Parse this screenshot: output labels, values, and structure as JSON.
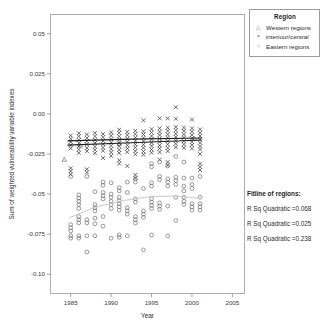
{
  "chart_data": {
    "type": "scatter",
    "title": "",
    "xlabel": "Year",
    "ylabel": "Sum of weighted vulnerability variable indexes",
    "xlim": [
      1982.5,
      2006.5
    ],
    "ylim": [
      -0.112,
      0.062
    ],
    "xticks": [
      "1985",
      "1990",
      "1995",
      "2000",
      "2005"
    ],
    "xtick_values": [
      1985,
      1990,
      1995,
      2000,
      2005
    ],
    "yticks": [
      "0.05",
      "0.025",
      "0.00",
      "-0.025",
      "-0.05",
      "-0.075",
      "-0.10"
    ],
    "ytick_values": [
      0.05,
      0.025,
      0.0,
      -0.025,
      -0.05,
      -0.075,
      -0.1
    ],
    "grid": false,
    "legend_position": "top-right",
    "series": [
      {
        "name": "Western regions",
        "marker": "triangle",
        "color": "#6e6e6e",
        "points": [
          [
            1984.2,
            -0.0285
          ],
          [
            1986.2,
            -0.0195
          ],
          [
            1991.0,
            -0.0185
          ],
          [
            2000.3,
            -0.0155
          ]
        ]
      },
      {
        "name": "interiour/central",
        "marker": "x",
        "color": "#3a3a3a",
        "points": [
          [
            1985.0,
            -0.0135
          ],
          [
            1985.0,
            -0.0155
          ],
          [
            1985.0,
            -0.0175
          ],
          [
            1985.0,
            -0.0195
          ],
          [
            1985.0,
            -0.0215
          ],
          [
            1985.0,
            -0.0338
          ],
          [
            1985.0,
            -0.0358
          ],
          [
            1985.0,
            -0.0378
          ],
          [
            1986.0,
            -0.012
          ],
          [
            1986.0,
            -0.014
          ],
          [
            1986.0,
            -0.0162
          ],
          [
            1986.0,
            -0.0182
          ],
          [
            1986.0,
            -0.0202
          ],
          [
            1986.0,
            -0.0222
          ],
          [
            1986.0,
            -0.0243
          ],
          [
            1987.0,
            -0.0128
          ],
          [
            1987.0,
            -0.015
          ],
          [
            1987.0,
            -0.017
          ],
          [
            1987.0,
            -0.019
          ],
          [
            1987.0,
            -0.0212
          ],
          [
            1987.0,
            -0.0232
          ],
          [
            1987.0,
            -0.0345
          ],
          [
            1987.0,
            -0.0365
          ],
          [
            1988.0,
            -0.0118
          ],
          [
            1988.0,
            -0.014
          ],
          [
            1988.0,
            -0.0162
          ],
          [
            1988.0,
            -0.0182
          ],
          [
            1988.0,
            -0.0204
          ],
          [
            1988.0,
            -0.0224
          ],
          [
            1988.0,
            -0.0245
          ],
          [
            1989.0,
            -0.0125
          ],
          [
            1989.0,
            -0.0146
          ],
          [
            1989.0,
            -0.0168
          ],
          [
            1989.0,
            -0.0188
          ],
          [
            1989.0,
            -0.021
          ],
          [
            1989.0,
            -0.023
          ],
          [
            1989.0,
            -0.0275
          ],
          [
            1990.0,
            -0.0115
          ],
          [
            1990.0,
            -0.0136
          ],
          [
            1990.0,
            -0.0158
          ],
          [
            1990.0,
            -0.0178
          ],
          [
            1990.0,
            -0.0198
          ],
          [
            1990.0,
            -0.022
          ],
          [
            1990.0,
            -0.024
          ],
          [
            1990.0,
            -0.0262
          ],
          [
            1991.0,
            -0.0098
          ],
          [
            1991.0,
            -0.0118
          ],
          [
            1991.0,
            -0.014
          ],
          [
            1991.0,
            -0.016
          ],
          [
            1991.0,
            -0.0182
          ],
          [
            1991.0,
            -0.0202
          ],
          [
            1991.0,
            -0.0224
          ],
          [
            1991.0,
            -0.0244
          ],
          [
            1991.0,
            -0.029
          ],
          [
            1991.0,
            -0.031
          ],
          [
            1992.0,
            -0.0112
          ],
          [
            1992.0,
            -0.0132
          ],
          [
            1992.0,
            -0.0154
          ],
          [
            1992.0,
            -0.0174
          ],
          [
            1992.0,
            -0.0196
          ],
          [
            1992.0,
            -0.0216
          ],
          [
            1992.0,
            -0.0238
          ],
          [
            1992.0,
            -0.0325
          ],
          [
            1993.0,
            -0.0105
          ],
          [
            1993.0,
            -0.0126
          ],
          [
            1993.0,
            -0.0148
          ],
          [
            1993.0,
            -0.0168
          ],
          [
            1993.0,
            -0.019
          ],
          [
            1993.0,
            -0.021
          ],
          [
            1993.0,
            -0.0232
          ],
          [
            1993.0,
            -0.0252
          ],
          [
            1993.0,
            -0.038
          ],
          [
            1993.0,
            -0.04
          ],
          [
            1994.0,
            -0.004
          ],
          [
            1994.0,
            -0.0108
          ],
          [
            1994.0,
            -0.0128
          ],
          [
            1994.0,
            -0.015
          ],
          [
            1994.0,
            -0.017
          ],
          [
            1994.0,
            -0.0192
          ],
          [
            1994.0,
            -0.0212
          ],
          [
            1994.0,
            -0.0234
          ],
          [
            1994.0,
            -0.0254
          ],
          [
            1995.0,
            -0.0095
          ],
          [
            1995.0,
            -0.0116
          ],
          [
            1995.0,
            -0.0138
          ],
          [
            1995.0,
            -0.0158
          ],
          [
            1995.0,
            -0.018
          ],
          [
            1995.0,
            -0.02
          ],
          [
            1995.0,
            -0.0222
          ],
          [
            1995.0,
            -0.0242
          ],
          [
            1996.0,
            -0.0028
          ],
          [
            1996.0,
            -0.009
          ],
          [
            1996.0,
            -0.0112
          ],
          [
            1996.0,
            -0.0132
          ],
          [
            1996.0,
            -0.0154
          ],
          [
            1996.0,
            -0.0174
          ],
          [
            1996.0,
            -0.0196
          ],
          [
            1996.0,
            -0.0216
          ],
          [
            1996.0,
            -0.0238
          ],
          [
            1996.0,
            -0.0285
          ],
          [
            1997.0,
            -0.0028
          ],
          [
            1997.0,
            -0.0086
          ],
          [
            1997.0,
            -0.0106
          ],
          [
            1997.0,
            -0.0128
          ],
          [
            1997.0,
            -0.0148
          ],
          [
            1997.0,
            -0.017
          ],
          [
            1997.0,
            -0.019
          ],
          [
            1997.0,
            -0.0212
          ],
          [
            1997.0,
            -0.0232
          ],
          [
            1997.0,
            -0.03
          ],
          [
            1997.0,
            -0.032
          ],
          [
            1998.0,
            0.0042
          ],
          [
            1998.0,
            -0.003
          ],
          [
            1998.0,
            -0.0082
          ],
          [
            1998.0,
            -0.0102
          ],
          [
            1998.0,
            -0.0124
          ],
          [
            1998.0,
            -0.0144
          ],
          [
            1998.0,
            -0.0166
          ],
          [
            1998.0,
            -0.0186
          ],
          [
            1998.0,
            -0.0208
          ],
          [
            1999.0,
            -0.0085
          ],
          [
            1999.0,
            -0.0106
          ],
          [
            1999.0,
            -0.0128
          ],
          [
            1999.0,
            -0.0148
          ],
          [
            1999.0,
            -0.017
          ],
          [
            1999.0,
            -0.019
          ],
          [
            1999.0,
            -0.0212
          ],
          [
            2000.0,
            -0.0035
          ],
          [
            2000.0,
            -0.009
          ],
          [
            2000.0,
            -0.011
          ],
          [
            2000.0,
            -0.0132
          ],
          [
            2000.0,
            -0.0152
          ],
          [
            2000.0,
            -0.0174
          ],
          [
            2000.0,
            -0.0194
          ],
          [
            2000.0,
            -0.0216
          ],
          [
            2001.0,
            -0.0096
          ],
          [
            2001.0,
            -0.0118
          ],
          [
            2001.0,
            -0.0138
          ],
          [
            2001.0,
            -0.016
          ],
          [
            2001.0,
            -0.018
          ],
          [
            2001.0,
            -0.0202
          ],
          [
            2001.0,
            -0.0222
          ],
          [
            2001.0,
            -0.025
          ],
          [
            2001.0,
            -0.031
          ],
          [
            2001.0,
            -0.033
          ],
          [
            2001.0,
            -0.035
          ]
        ]
      },
      {
        "name": "Eastern regions",
        "marker": "circle",
        "color": "#6e6e6e",
        "points": [
          [
            1985.0,
            -0.039
          ],
          [
            1985.0,
            -0.069
          ],
          [
            1985.0,
            -0.071
          ],
          [
            1985.0,
            -0.073
          ],
          [
            1985.0,
            -0.076
          ],
          [
            1985.0,
            -0.0775
          ],
          [
            1986.0,
            -0.0505
          ],
          [
            1986.0,
            -0.0525
          ],
          [
            1986.0,
            -0.0545
          ],
          [
            1986.0,
            -0.0565
          ],
          [
            1986.0,
            -0.059
          ],
          [
            1986.0,
            -0.064
          ],
          [
            1986.0,
            -0.066
          ],
          [
            1986.0,
            -0.068
          ],
          [
            1986.0,
            -0.076
          ],
          [
            1986.0,
            -0.0775
          ],
          [
            1987.0,
            -0.039
          ],
          [
            1987.0,
            -0.066
          ],
          [
            1987.0,
            -0.068
          ],
          [
            1987.0,
            -0.076
          ],
          [
            1987.0,
            -0.0862
          ],
          [
            1988.0,
            -0.0485
          ],
          [
            1988.0,
            -0.0565
          ],
          [
            1988.0,
            -0.0585
          ],
          [
            1988.0,
            -0.0605
          ],
          [
            1988.0,
            -0.065
          ],
          [
            1988.0,
            -0.0685
          ],
          [
            1988.0,
            -0.076
          ],
          [
            1989.0,
            -0.0425
          ],
          [
            1989.0,
            -0.0445
          ],
          [
            1989.0,
            -0.049
          ],
          [
            1989.0,
            -0.051
          ],
          [
            1989.0,
            -0.053
          ],
          [
            1989.0,
            -0.064
          ],
          [
            1989.0,
            -0.07
          ],
          [
            1990.0,
            -0.043
          ],
          [
            1990.0,
            -0.05
          ],
          [
            1990.0,
            -0.052
          ],
          [
            1990.0,
            -0.0545
          ],
          [
            1990.0,
            -0.0565
          ],
          [
            1990.0,
            -0.059
          ],
          [
            1990.0,
            -0.0775
          ],
          [
            1991.0,
            -0.046
          ],
          [
            1991.0,
            -0.048
          ],
          [
            1991.0,
            -0.052
          ],
          [
            1991.0,
            -0.054
          ],
          [
            1991.0,
            -0.056
          ],
          [
            1991.0,
            -0.058
          ],
          [
            1991.0,
            -0.06
          ],
          [
            1991.0,
            -0.0755
          ],
          [
            1991.0,
            -0.077
          ],
          [
            1992.0,
            -0.0425
          ],
          [
            1992.0,
            -0.049
          ],
          [
            1992.0,
            -0.0585
          ],
          [
            1992.0,
            -0.0605
          ],
          [
            1992.0,
            -0.0625
          ],
          [
            1992.0,
            -0.076
          ],
          [
            1993.0,
            -0.0405
          ],
          [
            1993.0,
            -0.0425
          ],
          [
            1993.0,
            -0.053
          ],
          [
            1993.0,
            -0.055
          ],
          [
            1993.0,
            -0.064
          ],
          [
            1993.0,
            -0.066
          ],
          [
            1993.0,
            -0.068
          ],
          [
            1994.0,
            -0.0465
          ],
          [
            1994.0,
            -0.0605
          ],
          [
            1994.0,
            -0.0625
          ],
          [
            1994.0,
            -0.0645
          ],
          [
            1994.0,
            -0.0848
          ],
          [
            1995.0,
            -0.031
          ],
          [
            1995.0,
            -0.033
          ],
          [
            1995.0,
            -0.043
          ],
          [
            1995.0,
            -0.045
          ],
          [
            1995.0,
            -0.053
          ],
          [
            1995.0,
            -0.055
          ],
          [
            1995.0,
            -0.057
          ],
          [
            1995.0,
            -0.059
          ],
          [
            1995.0,
            -0.0755
          ],
          [
            1996.0,
            -0.03
          ],
          [
            1996.0,
            -0.039
          ],
          [
            1996.0,
            -0.041
          ],
          [
            1996.0,
            -0.0555
          ],
          [
            1996.0,
            -0.0575
          ],
          [
            1996.0,
            -0.0595
          ],
          [
            1997.0,
            -0.0325
          ],
          [
            1997.0,
            -0.0405
          ],
          [
            1997.0,
            -0.0425
          ],
          [
            1997.0,
            -0.045
          ],
          [
            1997.0,
            -0.0575
          ],
          [
            1997.0,
            -0.076
          ],
          [
            1998.0,
            -0.0265
          ],
          [
            1998.0,
            -0.0395
          ],
          [
            1998.0,
            -0.0415
          ],
          [
            1998.0,
            -0.044
          ],
          [
            1998.0,
            -0.052
          ],
          [
            1998.0,
            -0.0665
          ],
          [
            1999.0,
            -0.03
          ],
          [
            1999.0,
            -0.04
          ],
          [
            1999.0,
            -0.045
          ],
          [
            1999.0,
            -0.048
          ],
          [
            1999.0,
            -0.052
          ],
          [
            1999.0,
            -0.0545
          ],
          [
            1999.0,
            -0.0565
          ],
          [
            2000.0,
            -0.04
          ],
          [
            2000.0,
            -0.044
          ],
          [
            2000.0,
            -0.0465
          ],
          [
            2000.0,
            -0.056
          ],
          [
            2000.0,
            -0.058
          ],
          [
            2000.0,
            -0.06
          ],
          [
            2001.0,
            -0.039
          ],
          [
            2001.0,
            -0.052
          ],
          [
            2001.0,
            -0.056
          ],
          [
            2001.0,
            -0.058
          ],
          [
            2001.0,
            -0.06
          ]
        ]
      }
    ],
    "fit_lines": [
      {
        "name": "Western regions fit",
        "style": "dark",
        "points": [
          [
            1984.6,
            -0.0195
          ],
          [
            1992.5,
            -0.018
          ],
          [
            2001.2,
            -0.0163
          ]
        ]
      },
      {
        "name": "interiour/central fit",
        "style": "dark",
        "points": [
          [
            1984.6,
            -0.0168
          ],
          [
            1992.5,
            -0.0157
          ],
          [
            2001.2,
            -0.015
          ]
        ]
      },
      {
        "name": "Eastern regions fit",
        "style": "light",
        "points": [
          [
            1984.8,
            -0.0648
          ],
          [
            1988.0,
            -0.0582
          ],
          [
            1991.5,
            -0.054
          ],
          [
            1995.0,
            -0.0515
          ],
          [
            1998.0,
            -0.0512
          ],
          [
            2001.2,
            -0.0528
          ]
        ]
      }
    ]
  },
  "legend": {
    "title": "Region",
    "items": [
      {
        "symbol": "△",
        "label": "Western regions"
      },
      {
        "symbol": "×",
        "label": "interiour/central"
      },
      {
        "symbol": "○",
        "label": "Eastern regions"
      }
    ]
  },
  "fit_panel": {
    "title": "Fitline of regions:",
    "rows": [
      "R Sq Quadratic =0.068",
      "R Sq Quadratic =0.025",
      "R Sq Quadratic =0.238"
    ]
  },
  "axes": {
    "x_title": "Year",
    "y_title": "Sum of weighted vulnerability variable indexes"
  }
}
